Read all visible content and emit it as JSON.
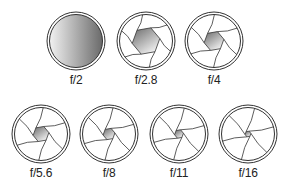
{
  "diagram": {
    "apertures": [
      {
        "label": "f/2",
        "cx": 76,
        "cy": 41,
        "hole_r": 0,
        "full_open": true
      },
      {
        "label": "f/2.8",
        "cx": 146,
        "cy": 41,
        "hole_r": 14,
        "full_open": false
      },
      {
        "label": "f/4",
        "cx": 214,
        "cy": 41,
        "hole_r": 10,
        "full_open": false
      },
      {
        "label": "f/5.6",
        "cx": 41,
        "cy": 134,
        "hole_r": 8,
        "full_open": false
      },
      {
        "label": "f/8",
        "cx": 109,
        "cy": 134,
        "hole_r": 6,
        "full_open": false
      },
      {
        "label": "f/11",
        "cx": 179,
        "cy": 134,
        "hole_r": 4.5,
        "full_open": false
      },
      {
        "label": "f/16",
        "cx": 248,
        "cy": 134,
        "hole_r": 3,
        "full_open": false
      }
    ],
    "colors": {
      "ring": "#333333",
      "blade_line": "#333333",
      "gradient_dark": "#6a6a6a",
      "gradient_light": "#f2f2f2",
      "label_text": "#222222"
    }
  }
}
